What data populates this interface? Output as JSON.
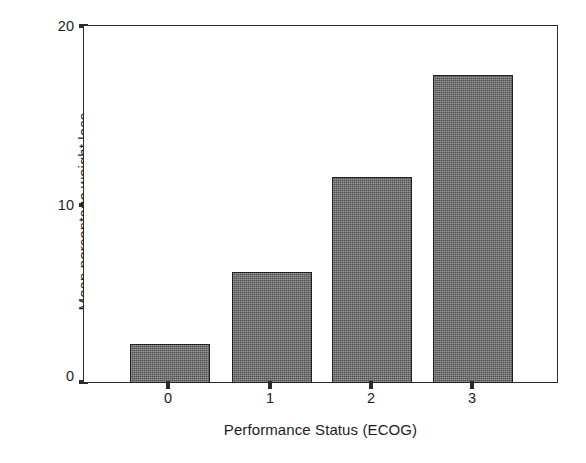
{
  "chart_data": {
    "type": "bar",
    "title": "",
    "subtitle": "",
    "xlabel": "Performance Status (ECOG)",
    "ylabel": "Mean percentage weight loss",
    "categories": [
      "0",
      "1",
      "2",
      "3"
    ],
    "values": [
      2.2,
      6.2,
      11.5,
      17.2
    ],
    "series": [
      {
        "name": "Mean percentage weight loss",
        "values": [
          2.2,
          6.2,
          11.5,
          17.2
        ]
      }
    ],
    "ylim": [
      0,
      20
    ],
    "yticks": [
      0,
      10,
      20
    ],
    "ytick_labels": [
      "0",
      "10",
      "20"
    ],
    "xtick_labels": [
      "0",
      "1",
      "2",
      "3"
    ],
    "grid": false,
    "legend": false,
    "legend_position": "none",
    "bar_color": "#6d6d6d",
    "bar_edge_color": "#222222",
    "axis_color": "#2b2b2b",
    "background_color": "#ffffff"
  }
}
